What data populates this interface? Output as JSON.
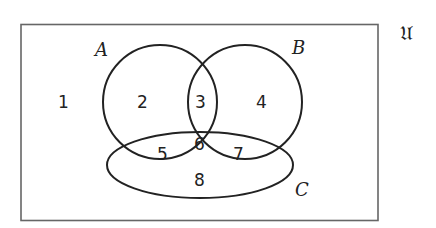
{
  "diagram": {
    "type": "venn",
    "universe": {
      "label": "𝔘"
    },
    "sets": [
      {
        "id": "A",
        "label": "A"
      },
      {
        "id": "B",
        "label": "B"
      },
      {
        "id": "C",
        "label": "C"
      }
    ],
    "regions": [
      {
        "label": "1",
        "membership": "outside A, B, C"
      },
      {
        "label": "2",
        "membership": "A only"
      },
      {
        "label": "3",
        "membership": "A and B, not C"
      },
      {
        "label": "4",
        "membership": "B only"
      },
      {
        "label": "5",
        "membership": "A and C, not B"
      },
      {
        "label": "6",
        "membership": "A, B and C"
      },
      {
        "label": "7",
        "membership": "B and C, not A"
      },
      {
        "label": "8",
        "membership": "C only"
      }
    ],
    "colors": {
      "stroke": "#222222",
      "frame": "#666666",
      "background": "#ffffff"
    }
  }
}
